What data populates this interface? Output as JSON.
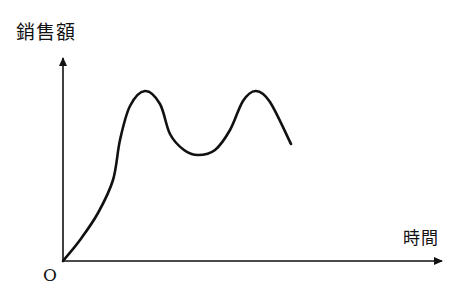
{
  "chart_data": {
    "type": "line",
    "title": "",
    "xlabel": "時間",
    "ylabel": "銷售額",
    "origin_label": "O",
    "grid": false,
    "legend": null,
    "axis_ticks": "none (qualitative axes)",
    "series": [
      {
        "name": "銷售額",
        "color": "#111111",
        "points_px": [
          [
            63,
            261
          ],
          [
            80,
            240
          ],
          [
            98,
            213
          ],
          [
            113,
            180
          ],
          [
            120,
            140
          ],
          [
            130,
            106
          ],
          [
            145,
            91
          ],
          [
            160,
            104
          ],
          [
            170,
            134
          ],
          [
            184,
            150
          ],
          [
            198,
            155
          ],
          [
            215,
            150
          ],
          [
            230,
            130
          ],
          [
            243,
            101
          ],
          [
            256,
            91
          ],
          [
            270,
            102
          ],
          [
            291,
            144
          ]
        ],
        "shape_relative": {
          "x": [
            0,
            0.045,
            0.092,
            0.132,
            0.151,
            0.176,
            0.216,
            0.255,
            0.282,
            0.318,
            0.355,
            0.4,
            0.439,
            0.474,
            0.508,
            0.545,
            0.6
          ],
          "y": [
            0,
            0.1,
            0.24,
            0.4,
            0.6,
            0.76,
            0.84,
            0.77,
            0.62,
            0.54,
            0.52,
            0.54,
            0.64,
            0.78,
            0.84,
            0.78,
            0.57
          ]
        }
      }
    ],
    "features": {
      "peak_1_px": [
        145,
        91
      ],
      "trough_px": [
        198,
        155
      ],
      "peak_2_px": [
        256,
        91
      ],
      "end_px": [
        291,
        144
      ]
    }
  },
  "axes": {
    "origin_px": [
      63,
      261
    ],
    "y_axis_top_px": [
      63,
      57
    ],
    "x_axis_end_px": [
      443,
      261
    ],
    "stroke_color": "#111111"
  },
  "labels": {
    "y_axis": "銷售額",
    "x_axis": "時間",
    "origin": "O"
  }
}
